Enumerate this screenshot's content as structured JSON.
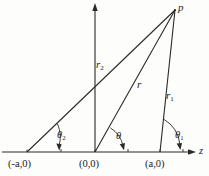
{
  "figure": {
    "background_color": "#fdfdfc",
    "ink_color": "#2a2a2a"
  },
  "point_p": {
    "label": "p",
    "x": 175,
    "y": 10
  },
  "axes": {
    "horizontal": {
      "name": "z-axis",
      "label": "z",
      "y": 152,
      "x_start": 2,
      "x_end": 196,
      "arrow": "right",
      "ticks": [
        27,
        61,
        95,
        128,
        160,
        183
      ]
    },
    "vertical": {
      "name": "vertical-axis",
      "label": "",
      "x": 95,
      "y_start": 152,
      "y_end": 4,
      "arrow": "up"
    }
  },
  "axis_points": [
    {
      "label": "(-a,0)",
      "x": 27,
      "y": 152
    },
    {
      "label": "(0,0)",
      "x": 95,
      "y": 152
    },
    {
      "label": "(a,0)",
      "x": 160,
      "y": 152
    }
  ],
  "segments": [
    {
      "name": "r2",
      "label_main": "r",
      "label_sub": "2",
      "from_x": 27,
      "from_y": 152,
      "to_x": 175,
      "to_y": 10
    },
    {
      "name": "r",
      "label_main": "r",
      "label_sub": "",
      "from_x": 95,
      "from_y": 152,
      "to_x": 175,
      "to_y": 10
    },
    {
      "name": "r1",
      "label_main": "r",
      "label_sub": "1",
      "from_x": 160,
      "from_y": 152,
      "to_x": 175,
      "to_y": 10
    }
  ],
  "angles": [
    {
      "name": "theta2",
      "label_main": "θ",
      "label_sub": "2",
      "vertex_x": 27,
      "vertex_y": 152
    },
    {
      "name": "theta",
      "label_main": "θ",
      "label_sub": "",
      "vertex_x": 95,
      "vertex_y": 152
    },
    {
      "name": "theta1",
      "label_main": "θ",
      "label_sub": "1",
      "vertex_x": 160,
      "vertex_y": 152
    }
  ]
}
